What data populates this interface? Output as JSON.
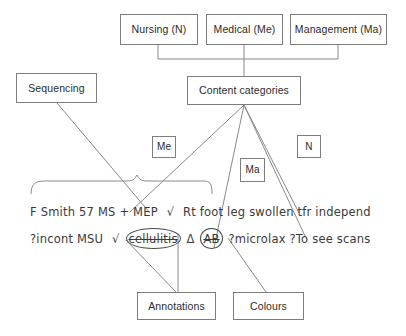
{
  "diagram": {
    "colors": {
      "box_border": "#7d7d7d",
      "box_text": "#2b2b2b",
      "connector": "#8a8a8a",
      "handwriting": "#3a3a3a",
      "background": "#ffffff"
    },
    "nodes": {
      "nursing": "Nursing (N)",
      "medical": "Medical (Me)",
      "management": "Management (Ma)",
      "sequencing": "Sequencing",
      "content_categories": "Content categories",
      "tag_me": "Me",
      "tag_ma": "Ma",
      "tag_n": "N",
      "annotations": "Annotations",
      "colours": "Colours"
    },
    "handwritten": {
      "line1": {
        "t1": "F Smith 57 MS + MEP",
        "t2": "√",
        "t3": "Rt foot leg swollen tfr independ"
      },
      "line2": {
        "t1": "?incont MSU",
        "t2": "√",
        "t3": "cellulitis",
        "t4": "Δ",
        "t5": "AB",
        "t6": "?microlax ?To see scans"
      }
    }
  }
}
